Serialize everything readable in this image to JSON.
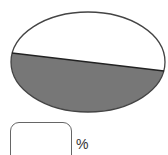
{
  "figure": {
    "shape": "ellipse",
    "shaded_region": "lower segment below slanted chord",
    "colors": {
      "outline": "#444444",
      "shade": "#777777",
      "background": "#ffffff"
    }
  },
  "answer": {
    "value": "",
    "unit": "%"
  }
}
